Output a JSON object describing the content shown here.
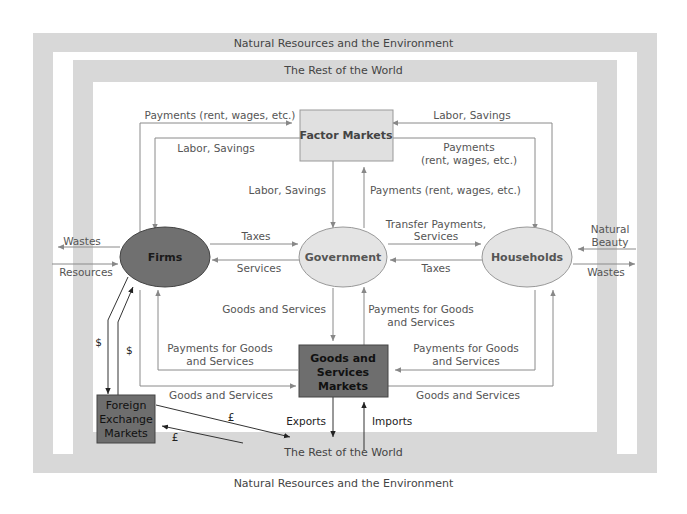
{
  "frames": {
    "outer_label": "Natural Resources and the Environment",
    "middle_label": "The Rest of the World"
  },
  "nodes": {
    "factor_markets": "Factor Markets",
    "firms": "Firms",
    "government": "Government",
    "households": "Households",
    "goods_services_markets": [
      "Goods and",
      "Services",
      "Markets"
    ],
    "foreign_exchange_markets": [
      "Foreign",
      "Exchange",
      "Markets"
    ]
  },
  "flows": {
    "firms_to_factor_payments": "Payments (rent, wages, etc.)",
    "factor_to_firms_labor": "Labor, Savings",
    "households_to_factor_labor": "Labor, Savings",
    "factor_to_households_payments": [
      "Payments",
      "(rent, wages, etc.)"
    ],
    "factor_to_government_labor": "Labor, Savings",
    "government_to_factor_payments": "Payments (rent, wages, etc.)",
    "firms_to_government_taxes": "Taxes",
    "government_to_firms_services": "Services",
    "government_to_households_transfer": [
      "Transfer Payments,",
      "Services"
    ],
    "households_to_government_taxes": "Taxes",
    "markets_to_government_goods": "Goods and Services",
    "government_to_markets_payments": [
      "Payments for Goods",
      "and Services"
    ],
    "markets_to_firms_payments": [
      "Payments for Goods",
      "and Services"
    ],
    "firms_to_markets_goods": "Goods and Services",
    "households_to_markets_payments": [
      "Payments for Goods",
      "and Services"
    ],
    "markets_to_households_goods": "Goods and Services",
    "firms_wastes": "Wastes",
    "firms_resources": "Resources",
    "households_natural_beauty": [
      "Natural",
      "Beauty"
    ],
    "households_wastes": "Wastes",
    "firms_to_fx_dollar": "$",
    "fx_to_firms_dollar": "$",
    "fx_pound_out": "£",
    "fx_pound_in": "£",
    "exports": "Exports",
    "imports": "Imports"
  },
  "colors": {
    "frame_gray": "#d8d8d8",
    "factor_box": "#e0e0e0",
    "firms_fill": "#707070",
    "gov_households_fill": "#e4e4e4",
    "dark_box": "#6e6e6e",
    "line": "#8a8a8a",
    "line_dark": "#333333"
  }
}
